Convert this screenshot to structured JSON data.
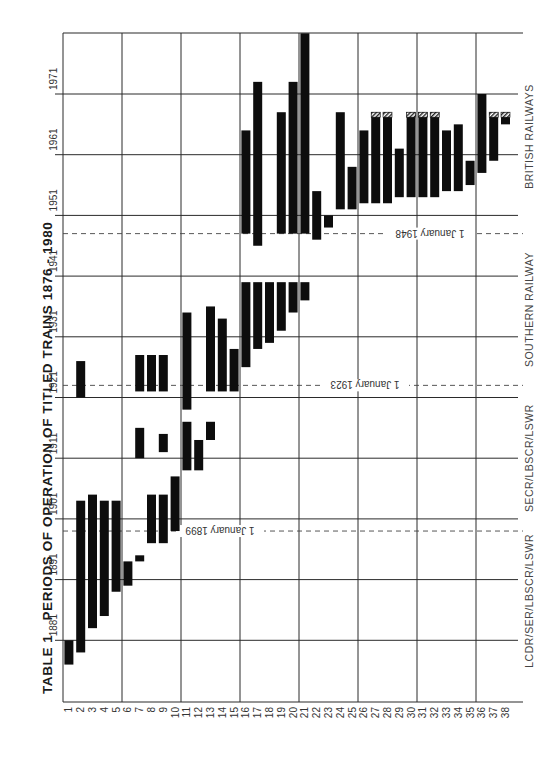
{
  "title": {
    "table_label": "TABLE 1",
    "text": "PERIODS OF OPERATION OF TITLED TRAINS  1876 - 1980"
  },
  "chart_data": {
    "type": "bar",
    "orientation": "floating-range (Gantt style, chart rotated 90°)",
    "xlabel": "Train number",
    "ylabel": "Year",
    "categories": [
      "1",
      "2",
      "3",
      "4",
      "5",
      "6",
      "7",
      "8",
      "9",
      "10",
      "11",
      "12",
      "13",
      "14",
      "15",
      "16",
      "17",
      "18",
      "19",
      "20",
      "21",
      "22",
      "23",
      "24",
      "25",
      "26",
      "27",
      "28",
      "29",
      "30",
      "31",
      "32",
      "33",
      "34",
      "35",
      "36",
      "37",
      "38"
    ],
    "year_ticks": [
      1881,
      1891,
      1901,
      1911,
      1921,
      1931,
      1941,
      1951,
      1961,
      1971
    ],
    "ylim": [
      1871,
      1981
    ],
    "grid": true,
    "periods": [
      {
        "train": 1,
        "spans": [
          [
            1877,
            1881
          ]
        ]
      },
      {
        "train": 2,
        "spans": [
          [
            1879,
            1904
          ],
          [
            1921,
            1927
          ]
        ]
      },
      {
        "train": 3,
        "spans": [
          [
            1883,
            1905
          ]
        ]
      },
      {
        "train": 4,
        "spans": [
          [
            1885,
            1904
          ]
        ]
      },
      {
        "train": 5,
        "spans": [
          [
            1889,
            1904
          ]
        ]
      },
      {
        "train": 6,
        "spans": [
          [
            1890,
            1894
          ]
        ]
      },
      {
        "train": 7,
        "spans": [
          [
            1894,
            1895
          ],
          [
            1911,
            1916
          ],
          [
            1922,
            1928
          ]
        ]
      },
      {
        "train": 8,
        "spans": [
          [
            1897,
            1905
          ],
          [
            1922,
            1928
          ]
        ]
      },
      {
        "train": 9,
        "spans": [
          [
            1897,
            1905
          ],
          [
            1912,
            1915
          ],
          [
            1922,
            1928
          ]
        ]
      },
      {
        "train": 10,
        "spans": [
          [
            1899,
            1908
          ]
        ]
      },
      {
        "train": 11,
        "spans": [
          [
            1909,
            1917
          ],
          [
            1919,
            1935
          ]
        ]
      },
      {
        "train": 12,
        "spans": [
          [
            1909,
            1914
          ]
        ]
      },
      {
        "train": 13,
        "spans": [
          [
            1914,
            1917
          ],
          [
            1922,
            1936
          ]
        ]
      },
      {
        "train": 14,
        "spans": [
          [
            1922,
            1934
          ]
        ]
      },
      {
        "train": 15,
        "spans": [
          [
            1922,
            1929
          ]
        ]
      },
      {
        "train": 16,
        "spans": [
          [
            1926,
            1940
          ],
          [
            1948,
            1965
          ]
        ]
      },
      {
        "train": 17,
        "spans": [
          [
            1929,
            1940
          ],
          [
            1946,
            1973
          ]
        ]
      },
      {
        "train": 18,
        "spans": [
          [
            1930,
            1940
          ]
        ]
      },
      {
        "train": 19,
        "spans": [
          [
            1932,
            1940
          ],
          [
            1948,
            1968
          ]
        ]
      },
      {
        "train": 20,
        "spans": [
          [
            1935,
            1940
          ],
          [
            1948,
            1973
          ]
        ]
      },
      {
        "train": 21,
        "spans": [
          [
            1937,
            1940
          ],
          [
            1948,
            1981
          ]
        ]
      },
      {
        "train": 22,
        "spans": [
          [
            1947,
            1955
          ]
        ]
      },
      {
        "train": 23,
        "spans": [
          [
            1949,
            1951
          ]
        ]
      },
      {
        "train": 24,
        "spans": [
          [
            1952,
            1968
          ]
        ]
      },
      {
        "train": 25,
        "spans": [
          [
            1952,
            1959
          ]
        ]
      },
      {
        "train": 26,
        "spans": [
          [
            1953,
            1965
          ]
        ]
      },
      {
        "train": 27,
        "spans": [
          [
            1953,
            1968
          ]
        ],
        "hatched_end": true
      },
      {
        "train": 28,
        "spans": [
          [
            1953,
            1968
          ]
        ],
        "hatched_end": true
      },
      {
        "train": 29,
        "spans": [
          [
            1954,
            1962
          ]
        ]
      },
      {
        "train": 30,
        "spans": [
          [
            1954,
            1968
          ]
        ],
        "hatched_end": true
      },
      {
        "train": 31,
        "spans": [
          [
            1954,
            1968
          ]
        ],
        "hatched_end": true
      },
      {
        "train": 32,
        "spans": [
          [
            1954,
            1968
          ]
        ],
        "hatched_end": true
      },
      {
        "train": 33,
        "spans": [
          [
            1955,
            1965
          ]
        ]
      },
      {
        "train": 34,
        "spans": [
          [
            1955,
            1966
          ]
        ]
      },
      {
        "train": 35,
        "spans": [
          [
            1956,
            1960
          ]
        ]
      },
      {
        "train": 36,
        "spans": [
          [
            1958,
            1971
          ]
        ]
      },
      {
        "train": 37,
        "spans": [
          [
            1960,
            1968
          ]
        ],
        "hatched_end": true
      },
      {
        "train": 38,
        "spans": [
          [
            1966,
            1968
          ]
        ],
        "hatched_end": true
      }
    ],
    "annotations": [
      {
        "label": "1 January 1899",
        "year": 1899.0
      },
      {
        "label": "1 January 1923",
        "year": 1923.0
      },
      {
        "label": "1 January 1948",
        "year": 1948.0
      }
    ],
    "eras": [
      {
        "label": "LCDR/SER/LBSCR/LSWR",
        "from": 1876,
        "to": 1899
      },
      {
        "label": "SECR/LBSCR/LSWR",
        "from": 1899,
        "to": 1923
      },
      {
        "label": "SOUTHERN RAILWAY",
        "from": 1923,
        "to": 1948
      },
      {
        "label": "BRITISH RAILWAYS",
        "from": 1948,
        "to": 1980
      }
    ]
  },
  "colors": {
    "bar": "#0d0d0d",
    "grid": "#2a2a2a",
    "text": "#333333",
    "background": "#ffffff"
  }
}
